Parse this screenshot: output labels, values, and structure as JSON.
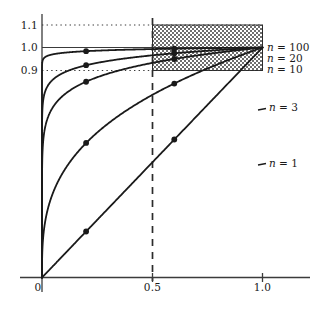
{
  "chart_data": {
    "type": "line",
    "title": "",
    "subtitle": "",
    "xlabel": "",
    "ylabel": "",
    "xlim": [
      0.0,
      1.08
    ],
    "ylim": [
      0.0,
      1.16
    ],
    "grid": false,
    "legend_position": "right-of-curve-ends",
    "x_ticks": [
      {
        "value": 0.0,
        "label": "0"
      },
      {
        "value": 0.5,
        "label": "0.5"
      },
      {
        "value": 1.0,
        "label": "1.0"
      }
    ],
    "y_ticks": [
      {
        "value": 0.9,
        "label": "0.9"
      },
      {
        "value": 1.0,
        "label": "1.0"
      },
      {
        "value": 1.1,
        "label": "1.1"
      }
    ],
    "series": [
      {
        "name": "n = 100",
        "label_n": "100",
        "exponent": 0.01,
        "marker_points": [
          {
            "x": 0.2,
            "y": 0.984
          },
          {
            "x": 0.6,
            "y": 0.995
          }
        ],
        "end_point": {
          "x": 1.0,
          "y": 1.0
        }
      },
      {
        "name": "n = 20",
        "label_n": "20",
        "exponent": 0.05,
        "marker_points": [
          {
            "x": 0.2,
            "y": 0.923
          },
          {
            "x": 0.6,
            "y": 0.975
          }
        ],
        "end_point": {
          "x": 1.0,
          "y": 1.0
        }
      },
      {
        "name": "n = 10",
        "label_n": "10",
        "exponent": 0.1,
        "marker_points": [
          {
            "x": 0.2,
            "y": 0.851
          },
          {
            "x": 0.6,
            "y": 0.95
          }
        ],
        "end_point": {
          "x": 1.0,
          "y": 1.0
        }
      },
      {
        "name": "n = 3",
        "label_n": "3",
        "exponent": 0.333333,
        "marker_points": [
          {
            "x": 0.2,
            "y": 0.585
          },
          {
            "x": 0.6,
            "y": 0.843
          }
        ],
        "end_point": {
          "x": 1.0,
          "y": 1.0
        }
      },
      {
        "name": "n = 1",
        "label_n": "1",
        "exponent": 1.0,
        "marker_points": [
          {
            "x": 0.2,
            "y": 0.2
          },
          {
            "x": 0.6,
            "y": 0.6
          }
        ],
        "end_point": {
          "x": 1.0,
          "y": 1.0
        }
      }
    ],
    "annotations": {
      "band": {
        "name": "hatched-band",
        "x_from": 0.5,
        "x_to": 1.0,
        "y_from": 0.9,
        "y_to": 1.1,
        "pattern": "crosshatch"
      },
      "reference_lines": [
        {
          "name": "y-1.1-dotted",
          "orientation": "horizontal",
          "value": 1.1,
          "style": "dotted"
        },
        {
          "name": "y-1.0-solid",
          "orientation": "horizontal",
          "value": 1.0,
          "style": "solid"
        },
        {
          "name": "y-0.9-dotted",
          "orientation": "horizontal",
          "value": 0.9,
          "style": "dotted"
        },
        {
          "name": "x-0.5-dashed",
          "orientation": "vertical",
          "value": 0.5,
          "style": "dashed"
        }
      ]
    },
    "colors": {
      "curve": "#1a1a1a",
      "axis": "#3b3b3b",
      "band_fill": "#9a9a9a",
      "background": "#ffffff",
      "text": "#1a1a1a"
    }
  },
  "labels": {
    "y_1_1": "1.1",
    "y_1_0": "1.0",
    "y_0_9": "0.9",
    "x_0": "0",
    "x_0_5": "0.5",
    "x_1_0": "1.0",
    "eq": "=",
    "n_italic": "n",
    "n100": "100",
    "n20": "20",
    "n10": "10",
    "n3": "3",
    "n1": "1"
  }
}
